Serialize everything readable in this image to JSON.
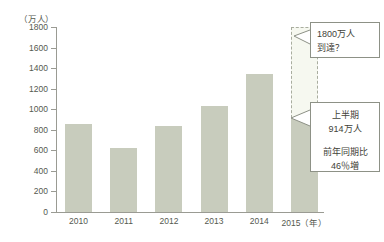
{
  "chart_data": {
    "type": "bar",
    "title": "",
    "xlabel": "",
    "ylabel": "（万人）",
    "y_unit": "（万人）",
    "categories": [
      "2010",
      "2011",
      "2012",
      "2013",
      "2014",
      "2015"
    ],
    "x_tick_labels": [
      "2010",
      "2011",
      "2012",
      "2013",
      "2014",
      "2015（年）"
    ],
    "x_axis_unit_suffix": "（年）",
    "values": [
      861,
      622,
      836,
      1036,
      1341,
      914
    ],
    "ylim": [
      0,
      1800
    ],
    "y_ticks": [
      0,
      200,
      400,
      600,
      800,
      1000,
      1200,
      1400,
      1600,
      1800
    ],
    "y_tick_labels": [
      "0",
      "200",
      "400",
      "600",
      "800",
      "1000",
      "1200",
      "1400",
      "1600",
      "1800"
    ],
    "grid": false,
    "legend": "none",
    "bar_color": "#c8ccbd",
    "projection": {
      "category": "2015",
      "actual_value": 914,
      "projected_value": 1800,
      "style": "dashed-outline"
    },
    "annotations": [
      {
        "name": "projection-callout",
        "lines": [
          "1800万人",
          "到達？"
        ],
        "points_to": "2015-projected-top"
      },
      {
        "name": "first-half-callout",
        "block1": [
          "上半期",
          "914万人"
        ],
        "block2": [
          "前年同期比",
          "46％増"
        ],
        "points_to": "2015-actual-top"
      }
    ]
  },
  "axis": {
    "unit_label": "（万人）",
    "ticks": [
      {
        "value": 1800,
        "label": "1800"
      },
      {
        "value": 1600,
        "label": "1600"
      },
      {
        "value": 1400,
        "label": "1400"
      },
      {
        "value": 1200,
        "label": "1200"
      },
      {
        "value": 1000,
        "label": "1000"
      },
      {
        "value": 800,
        "label": "800"
      },
      {
        "value": 600,
        "label": "600"
      },
      {
        "value": 400,
        "label": "400"
      },
      {
        "value": 200,
        "label": "200"
      },
      {
        "value": 0,
        "label": "0"
      }
    ]
  },
  "x_labels": [
    {
      "label": "2010"
    },
    {
      "label": "2011"
    },
    {
      "label": "2012"
    },
    {
      "label": "2013"
    },
    {
      "label": "2014"
    },
    {
      "label": "2015（年）"
    }
  ],
  "callouts": {
    "projection": {
      "line1": "1800万人",
      "line2": "到達？"
    },
    "first_half": {
      "line1": "上半期",
      "line2": "914万人",
      "line3": "前年同期比",
      "line4": "46％増"
    }
  },
  "colors": {
    "bar": "#c8ccbd",
    "projection_fill": "#f6f8f0",
    "projection_border": "#a9ad9f",
    "axis": "#9a9b93",
    "text": "#55594f",
    "callout_border": "#8d9186"
  }
}
